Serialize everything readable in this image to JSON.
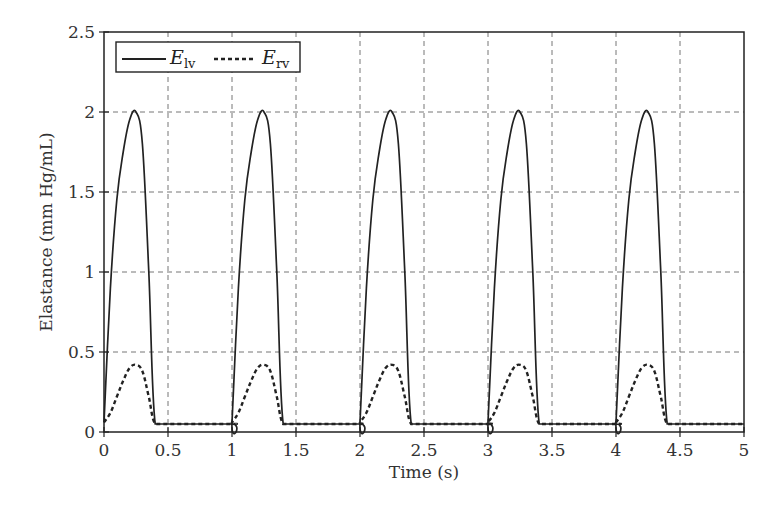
{
  "chart_data": {
    "type": "line",
    "title": "",
    "xlabel": "Time (s)",
    "ylabel": "Elastance (mm Hg/mL)",
    "xlim": [
      0,
      5
    ],
    "ylim": [
      0,
      2.5
    ],
    "xticks": [
      0,
      0.5,
      1,
      1.5,
      2,
      2.5,
      3,
      3.5,
      4,
      4.5,
      5
    ],
    "xtick_labels": [
      "0",
      "0.5",
      "1",
      "1.5",
      "2",
      "2.5",
      "3",
      "3.5",
      "4",
      "4.5",
      "5"
    ],
    "yticks": [
      0,
      0.5,
      1,
      1.5,
      2,
      2.5
    ],
    "ytick_labels": [
      "0",
      "0.5",
      "1",
      "1.5",
      "2",
      "2.5"
    ],
    "grid": true,
    "legend_position": "upper left",
    "period_s": 1.0,
    "series": [
      {
        "name": "E_lv",
        "legend_main": "E",
        "legend_sub": "lv",
        "style": "solid",
        "color": "#222222",
        "peak": 2.0,
        "baseline": 0.05,
        "peak_time_in_cycle": 0.25,
        "systole_end_in_cycle": 0.4,
        "x": [
          0,
          0.05,
          0.1,
          0.15,
          0.2,
          0.25,
          0.3,
          0.35,
          0.4,
          0.5,
          1.0
        ],
        "values": [
          0.06,
          0.9,
          1.45,
          1.75,
          1.95,
          2.0,
          1.8,
          1.0,
          0.05,
          0.05,
          0.05
        ]
      },
      {
        "name": "E_rv",
        "legend_main": "E",
        "legend_sub": "rv",
        "style": "dotted",
        "color": "#222222",
        "peak": 0.42,
        "baseline": 0.05,
        "peak_time_in_cycle": 0.25,
        "systole_end_in_cycle": 0.4,
        "x": [
          0,
          0.05,
          0.1,
          0.15,
          0.2,
          0.25,
          0.3,
          0.35,
          0.4,
          0.5,
          1.0
        ],
        "values": [
          0.06,
          0.12,
          0.22,
          0.32,
          0.4,
          0.42,
          0.38,
          0.22,
          0.05,
          0.05,
          0.05
        ]
      }
    ]
  }
}
